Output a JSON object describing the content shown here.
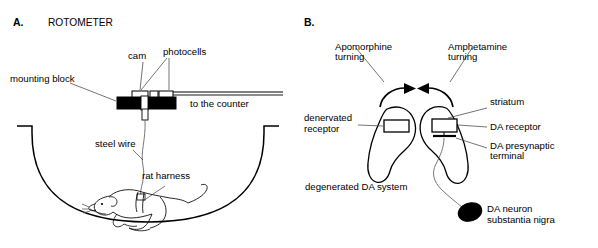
{
  "figure": {
    "background_color": "#ffffff",
    "ink_color": "#000000",
    "leader_color": "#3a3a3a"
  },
  "panel_a": {
    "letter": "A.",
    "title": "ROTOMETER",
    "labels": {
      "mounting_block": "mounting block",
      "cam": "cam",
      "photocells": "photocells",
      "to_the_counter": "to the counter",
      "steel_wire": "steel wire",
      "rat_harness": "rat harness"
    },
    "parts": {
      "block_fill": "#000000",
      "cam_fill": "#ffffff",
      "bowl_shape": "hemispherical-arena"
    }
  },
  "panel_b": {
    "letter": "B.",
    "labels": {
      "apomorphine_turning_line1": "Apomorphine",
      "apomorphine_turning_line2": "turning",
      "amphetamine_turning_line1": "Amphetamine",
      "amphetamine_turning_line2": "turning",
      "denervated_receptor_line1": "denervated",
      "denervated_receptor_line2": "receptor",
      "degenerated_da_system": "degenerated DA system",
      "striatum": "striatum",
      "da_receptor": "DA receptor",
      "da_presynaptic_line1": "DA presynaptic",
      "da_presynaptic_line2": "terminal",
      "da_neuron_line1": "DA neuron",
      "da_neuron_line2": "substantia nigra"
    },
    "parts": {
      "soma_fill": "#000000",
      "receptor_fill": "#ffffff",
      "left_arrow_direction": "clockwise-right",
      "right_arrow_direction": "counterclockwise-left"
    }
  }
}
